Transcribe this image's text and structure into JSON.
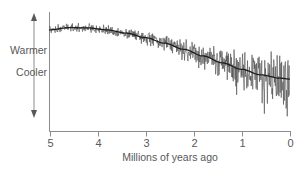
{
  "chart_data": {
    "type": "line",
    "title": "",
    "subtitle": "",
    "xlabel": "Millions of years ago",
    "ylabel": "",
    "x_ticks": [
      5,
      4,
      3,
      2,
      1,
      0
    ],
    "x_tick_labels": [
      "5",
      "4",
      "3",
      "2",
      "1",
      "0"
    ],
    "xlim": [
      5,
      0
    ],
    "x_axis_direction": "reversed",
    "ylim": [
      0,
      1
    ],
    "y_axis_labels": [
      "Warmer",
      "Cooler"
    ],
    "y_axis_ticks_shown": false,
    "y_axis_arrow": "double-headed-vertical",
    "grid": false,
    "legend": null,
    "annotations": [],
    "series": [
      {
        "name": "Proxy temperature record (noisy)",
        "role": "raw-signal",
        "color": "#4a4a4a",
        "description": "High-frequency oscillating benthic isotope proxy record; amplitude increases strongly toward present",
        "x": [
          5.0,
          4.9,
          4.8,
          4.7,
          4.6,
          4.5,
          4.4,
          4.3,
          4.2,
          4.1,
          4.0,
          3.9,
          3.8,
          3.7,
          3.6,
          3.5,
          3.4,
          3.3,
          3.2,
          3.1,
          3.0,
          2.9,
          2.8,
          2.7,
          2.6,
          2.5,
          2.4,
          2.3,
          2.2,
          2.1,
          2.0,
          1.9,
          1.8,
          1.7,
          1.6,
          1.5,
          1.4,
          1.3,
          1.2,
          1.1,
          1.0,
          0.9,
          0.8,
          0.7,
          0.6,
          0.5,
          0.4,
          0.3,
          0.2,
          0.1,
          0.0
        ],
        "values": [
          0.87,
          0.9,
          0.86,
          0.91,
          0.88,
          0.92,
          0.89,
          0.93,
          0.9,
          0.88,
          0.91,
          0.86,
          0.89,
          0.84,
          0.87,
          0.83,
          0.86,
          0.8,
          0.84,
          0.78,
          0.82,
          0.74,
          0.79,
          0.7,
          0.76,
          0.66,
          0.73,
          0.62,
          0.7,
          0.58,
          0.67,
          0.55,
          0.64,
          0.5,
          0.61,
          0.46,
          0.58,
          0.42,
          0.55,
          0.38,
          0.53,
          0.32,
          0.5,
          0.28,
          0.48,
          0.22,
          0.46,
          0.18,
          0.44,
          0.14,
          0.43
        ]
      },
      {
        "name": "Smoothed long-term trend",
        "role": "trend-line",
        "color": "#1c1c1c",
        "description": "Smooth declining curve: slight warming peak near 4.4 Ma, then steady cooling to present",
        "x": [
          5.0,
          4.6,
          4.2,
          3.8,
          3.4,
          3.0,
          2.6,
          2.2,
          1.8,
          1.4,
          1.0,
          0.6,
          0.2,
          0.0
        ],
        "values": [
          0.875,
          0.895,
          0.893,
          0.875,
          0.845,
          0.805,
          0.755,
          0.7,
          0.64,
          0.578,
          0.52,
          0.47,
          0.44,
          0.432
        ]
      }
    ]
  },
  "axis": {
    "x_axis_name": "time-axis",
    "y_axis_name": "temperature-axis",
    "tick_color": "#8c8c8e",
    "axis_color": "#8c8c8e"
  },
  "labels": {
    "warmer": "Warmer",
    "cooler": "Cooler",
    "x_title": "Millions of years ago"
  }
}
